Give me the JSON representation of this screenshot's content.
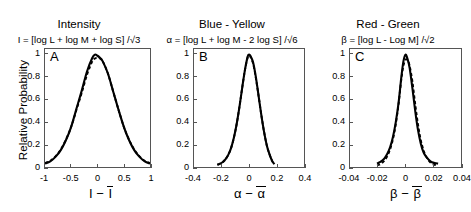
{
  "figure": {
    "ylabel": "Relative Probability",
    "background": "#ffffff",
    "solid_color": "#000000",
    "dashed_color": "#000000"
  },
  "panels": [
    {
      "letter": "A",
      "title": "Intensity",
      "formula": "I = [log L + log M + log S] /√3",
      "xlabel_lead": "I",
      "xlabel_minus": "−",
      "xlabel_bar": "I",
      "xticks": [
        "-1",
        "-0.5",
        "0",
        "0.5",
        "1"
      ],
      "yticks": [
        "0",
        "0.2",
        "0.4",
        "0.6",
        "0.8",
        "1"
      ]
    },
    {
      "letter": "B",
      "title": "Blue - Yellow",
      "formula": "α = [log L + log M - 2 log S] /√6",
      "xlabel_lead": "α",
      "xlabel_minus": "−",
      "xlabel_bar": "α",
      "xticks": [
        "-0.4",
        "-0.2",
        "0",
        "0.2",
        "0.4"
      ],
      "yticks": [
        "0",
        "0.2",
        "0.4",
        "0.6",
        "0.8",
        "1"
      ]
    },
    {
      "letter": "C",
      "title": "Red - Green",
      "formula": "β = [log L - Log M] /√2",
      "xlabel_lead": "β",
      "xlabel_minus": "−",
      "xlabel_bar": "β",
      "xticks": [
        "-0.04",
        "-0.02",
        "0",
        "0.02",
        "0.04"
      ],
      "yticks": [
        "0",
        "0.2",
        "0.4",
        "0.6",
        "0.8",
        "1"
      ]
    }
  ],
  "chart_data": [
    {
      "type": "line",
      "panel": "A",
      "title": "Intensity",
      "xlabel": "I − I̅",
      "ylabel": "Relative Probability",
      "xlim": [
        -1,
        1
      ],
      "ylim": [
        0,
        1.05
      ],
      "xticks": [
        -1,
        -0.5,
        0,
        0.5,
        1
      ],
      "yticks": [
        0,
        0.2,
        0.4,
        0.6,
        0.8,
        1
      ],
      "grid": false,
      "legend": null,
      "series": [
        {
          "name": "measured distribution",
          "style": "solid",
          "x": [
            -1.0,
            -0.9,
            -0.8,
            -0.7,
            -0.6,
            -0.5,
            -0.4,
            -0.3,
            -0.2,
            -0.1,
            -0.05,
            0.0,
            0.05,
            0.1,
            0.2,
            0.3,
            0.4,
            0.5,
            0.6,
            0.7,
            0.8,
            0.9,
            1.0
          ],
          "y": [
            0.03,
            0.05,
            0.09,
            0.15,
            0.24,
            0.36,
            0.52,
            0.68,
            0.85,
            0.97,
            1.0,
            0.99,
            0.97,
            0.94,
            0.83,
            0.67,
            0.51,
            0.36,
            0.24,
            0.15,
            0.09,
            0.05,
            0.03
          ]
        },
        {
          "name": "gaussian fit",
          "style": "dashed",
          "x": [
            -1.0,
            -0.9,
            -0.8,
            -0.7,
            -0.6,
            -0.5,
            -0.4,
            -0.3,
            -0.2,
            -0.1,
            -0.05,
            0.0,
            0.05,
            0.1,
            0.2,
            0.3,
            0.4,
            0.5,
            0.6,
            0.7,
            0.8,
            0.9,
            1.0
          ],
          "y": [
            0.035,
            0.055,
            0.095,
            0.155,
            0.245,
            0.36,
            0.51,
            0.66,
            0.82,
            0.94,
            0.965,
            0.97,
            0.965,
            0.94,
            0.83,
            0.67,
            0.51,
            0.36,
            0.245,
            0.155,
            0.095,
            0.055,
            0.035
          ]
        }
      ]
    },
    {
      "type": "line",
      "panel": "B",
      "title": "Blue - Yellow",
      "xlabel": "α − α̅",
      "ylabel": "Relative Probability",
      "xlim": [
        -0.4,
        0.4
      ],
      "ylim": [
        0,
        1.05
      ],
      "xticks": [
        -0.4,
        -0.2,
        0,
        0.2,
        0.4
      ],
      "yticks": [
        0,
        0.2,
        0.4,
        0.6,
        0.8,
        1
      ],
      "grid": false,
      "legend": null,
      "series": [
        {
          "name": "measured distribution",
          "style": "solid",
          "x": [
            -0.23,
            -0.21,
            -0.19,
            -0.17,
            -0.15,
            -0.13,
            -0.11,
            -0.09,
            -0.07,
            -0.05,
            -0.03,
            -0.01,
            0.0,
            0.01,
            0.03,
            0.05,
            0.07,
            0.09,
            0.11,
            0.13,
            0.15,
            0.17,
            0.185
          ],
          "y": [
            0.02,
            0.03,
            0.045,
            0.07,
            0.11,
            0.17,
            0.26,
            0.38,
            0.53,
            0.7,
            0.86,
            0.98,
            1.0,
            0.99,
            0.93,
            0.8,
            0.63,
            0.46,
            0.31,
            0.19,
            0.11,
            0.05,
            0.025
          ]
        },
        {
          "name": "gaussian fit",
          "style": "dashed",
          "x": [
            -0.23,
            -0.21,
            -0.19,
            -0.17,
            -0.15,
            -0.13,
            -0.11,
            -0.09,
            -0.07,
            -0.05,
            -0.03,
            -0.01,
            0.0,
            0.01,
            0.03,
            0.05,
            0.07,
            0.09,
            0.11,
            0.13,
            0.15,
            0.17,
            0.185
          ],
          "y": [
            0.02,
            0.03,
            0.045,
            0.07,
            0.11,
            0.17,
            0.26,
            0.38,
            0.53,
            0.7,
            0.86,
            0.975,
            0.99,
            0.98,
            0.92,
            0.79,
            0.63,
            0.46,
            0.31,
            0.19,
            0.11,
            0.05,
            0.025
          ]
        }
      ]
    },
    {
      "type": "line",
      "panel": "C",
      "title": "Red - Green",
      "xlabel": "β − β̅",
      "ylabel": "Relative Probability",
      "xlim": [
        -0.04,
        0.04
      ],
      "ylim": [
        0,
        1.05
      ],
      "xticks": [
        -0.04,
        -0.02,
        0,
        0.02,
        0.04
      ],
      "yticks": [
        0,
        0.2,
        0.4,
        0.6,
        0.8,
        1
      ],
      "grid": false,
      "legend": null,
      "series": [
        {
          "name": "measured distribution",
          "style": "solid",
          "x": [
            -0.0205,
            -0.019,
            -0.017,
            -0.015,
            -0.013,
            -0.011,
            -0.009,
            -0.007,
            -0.005,
            -0.003,
            -0.0015,
            0.0,
            0.0015,
            0.003,
            0.005,
            0.007,
            0.009,
            0.011,
            0.013,
            0.015,
            0.018,
            0.021,
            0.0235
          ],
          "y": [
            0.03,
            0.04,
            0.055,
            0.08,
            0.12,
            0.18,
            0.27,
            0.4,
            0.57,
            0.8,
            0.94,
            1.0,
            0.96,
            0.88,
            0.7,
            0.5,
            0.33,
            0.21,
            0.13,
            0.09,
            0.05,
            0.035,
            0.03
          ]
        },
        {
          "name": "gaussian fit",
          "style": "dashed",
          "x": [
            -0.0205,
            -0.019,
            -0.017,
            -0.015,
            -0.013,
            -0.011,
            -0.009,
            -0.007,
            -0.005,
            -0.003,
            -0.0015,
            0.0,
            0.0015,
            0.003,
            0.005,
            0.007,
            0.009,
            0.011,
            0.013,
            0.015,
            0.018,
            0.021,
            0.0235
          ],
          "y": [
            0.015,
            0.02,
            0.035,
            0.06,
            0.1,
            0.16,
            0.25,
            0.38,
            0.56,
            0.78,
            0.9,
            0.955,
            0.95,
            0.9,
            0.76,
            0.56,
            0.38,
            0.24,
            0.15,
            0.09,
            0.04,
            0.02,
            0.012
          ]
        }
      ]
    }
  ]
}
